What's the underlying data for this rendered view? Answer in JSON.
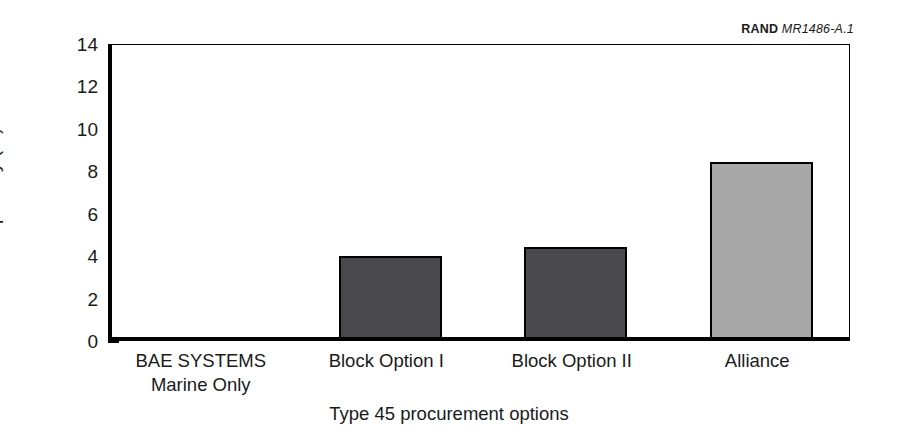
{
  "credit": {
    "brand": "RAND",
    "id": "MR1486-A.1"
  },
  "chart_data": {
    "type": "bar",
    "title": "",
    "subtitle": "",
    "xlabel": "Type 45 procurement options",
    "ylabel": "Cost penalty (%)",
    "categories": [
      "BAE SYSTEMS\nMarine Only",
      "Block Option I",
      "Block Option II",
      "Alliance"
    ],
    "category_lines": [
      [
        "BAE SYSTEMS",
        "Marine Only"
      ],
      [
        "Block Option I"
      ],
      [
        "Block Option II"
      ],
      [
        "Alliance"
      ]
    ],
    "values": [
      0,
      3.8,
      4.25,
      8.25
    ],
    "bar_colors": [
      "#4a4a4c",
      "#4a4a4c",
      "#4a4a4c",
      "#a8a8a8"
    ],
    "bar_edge_color": "#000000",
    "ylim": [
      0,
      14
    ],
    "yticks": [
      0,
      2,
      4,
      6,
      8,
      10,
      12,
      14
    ],
    "ytick_labels": [
      "0",
      "2",
      "4",
      "6",
      "8",
      "10",
      "12",
      "14"
    ],
    "grid": false,
    "legend": "none"
  }
}
